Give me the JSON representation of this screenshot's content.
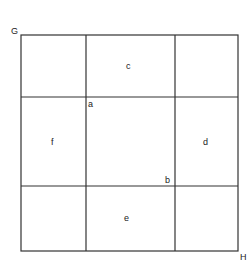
{
  "diagram": {
    "corner_labels": {
      "top_left": "G",
      "bottom_right": "H"
    },
    "point_labels": {
      "inner_top_left": "a",
      "inner_bottom_right": "b"
    },
    "region_labels": {
      "top": "c",
      "right": "d",
      "bottom": "e",
      "left": "f"
    },
    "line_color": "#333333"
  }
}
